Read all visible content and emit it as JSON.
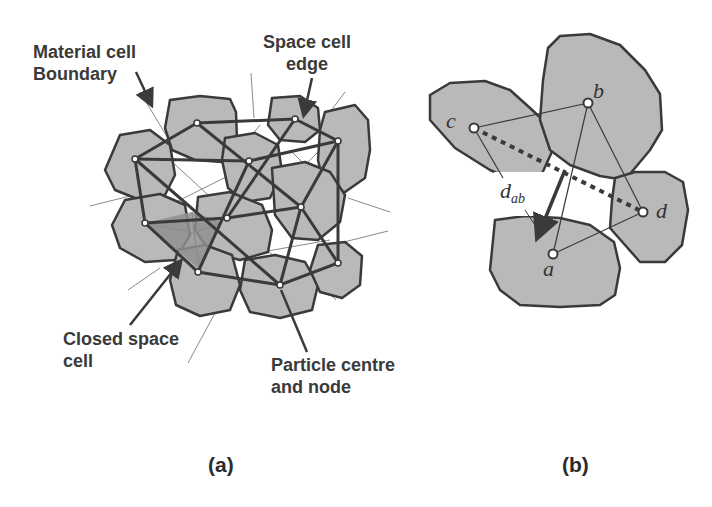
{
  "figure": {
    "panels": [
      {
        "id": "a",
        "caption": "(a)",
        "annotations": {
          "material_cell_boundary": [
            "Material cell",
            "Boundary"
          ],
          "space_cell_edge": [
            "Space cell",
            "edge"
          ],
          "closed_space_cell": [
            "Closed space",
            "cell"
          ],
          "particle_centre_node": [
            "Particle centre",
            "and node"
          ]
        }
      },
      {
        "id": "b",
        "caption": "(b)",
        "nodes": {
          "a": "a",
          "b": "b",
          "c": "c",
          "d": "d"
        },
        "distance_label": {
          "symbol": "d",
          "subscript": "ab"
        }
      }
    ],
    "colors": {
      "particle_fill": "#b9b9b9",
      "particle_stroke": "#3a3a3a",
      "closed_cell_fill": "#8f8f8f",
      "thin_line": "#8a8a8a",
      "text": "#3a3a3a"
    }
  }
}
